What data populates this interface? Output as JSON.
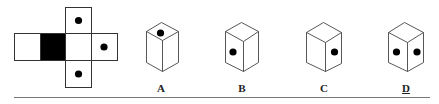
{
  "figure": {
    "type": "cube-net-folding-puzzle",
    "net": {
      "squares": [
        {
          "id": "top",
          "fill": "white",
          "dots": 1
        },
        {
          "id": "left-end",
          "fill": "white",
          "dots": 0
        },
        {
          "id": "shaded",
          "fill": "black",
          "dots": 0
        },
        {
          "id": "center",
          "fill": "white",
          "dots": 0
        },
        {
          "id": "right",
          "fill": "white",
          "dots": 1
        },
        {
          "id": "bottom",
          "fill": "white",
          "dots": 1
        }
      ]
    },
    "options": [
      {
        "label": "A",
        "description": "dot on top face",
        "underlined": false
      },
      {
        "label": "B",
        "description": "dot on left face",
        "underlined": false
      },
      {
        "label": "C",
        "description": "dot on right face",
        "underlined": false
      },
      {
        "label": "D",
        "description": "dots on left and right faces",
        "underlined": true
      }
    ],
    "answer": "D"
  }
}
